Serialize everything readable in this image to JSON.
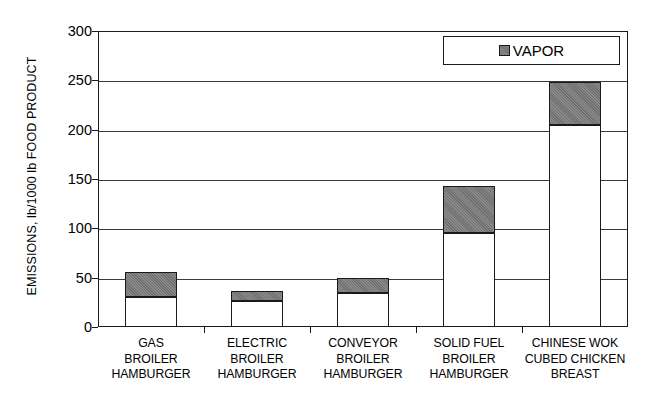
{
  "chart_data": {
    "type": "bar",
    "stacked": true,
    "title": "",
    "xlabel": "",
    "ylabel": "EMISSIONS, lb/1000 lb FOOD PRODUCT",
    "ylim": [
      0,
      300
    ],
    "yticks": [
      0,
      50,
      100,
      150,
      200,
      250,
      300
    ],
    "ytick_labels": [
      "0",
      "50",
      "100",
      "150",
      "200",
      "250",
      "300"
    ],
    "grid": "horizontal",
    "categories": [
      "GAS BROILER HAMBURGER",
      "ELECTRIC BROILER HAMBURGER",
      "CONVEYOR BROILER HAMBURGER",
      "SOLID FUEL BROILER HAMBURGER",
      "CHINESE WOK CUBED CHICKEN BREAST"
    ],
    "category_lines": [
      [
        "GAS",
        "BROILER",
        "HAMBURGER"
      ],
      [
        "ELECTRIC",
        "BROILER",
        "HAMBURGER"
      ],
      [
        "CONVEYOR",
        "BROILER",
        "HAMBURGER"
      ],
      [
        "SOLID FUEL",
        "BROILER",
        "HAMBURGER"
      ],
      [
        "CHINESE WOK",
        "CUBED CHICKEN",
        "BREAST"
      ]
    ],
    "series": [
      {
        "name": "PARTICULATE",
        "color": "#ffffff",
        "values": [
          30,
          26,
          34,
          95,
          205
        ]
      },
      {
        "name": "VAPOR",
        "color": "#7d7d7d",
        "values": [
          26,
          11,
          16,
          48,
          43
        ]
      }
    ],
    "totals": [
      56,
      37,
      50,
      143,
      248
    ],
    "legend": {
      "position": "top-right",
      "entries": [
        {
          "label": "VAPOR",
          "color": "#7d7d7d"
        }
      ]
    },
    "colors": {
      "vapor": "#7d7d7d",
      "base": "#ffffff",
      "axis": "#1a1a1a",
      "grid": "#3a3a3a",
      "background": "#ffffff"
    }
  },
  "legend": {
    "vapor_label": "VAPOR"
  }
}
